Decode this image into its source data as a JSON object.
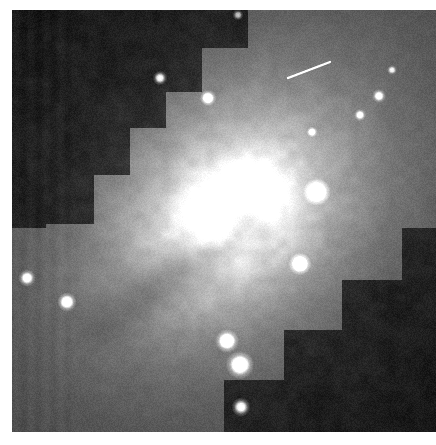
{
  "image": {
    "kind": "astronomical-observation",
    "subject": "spiral galaxy with bright nucleus and dust lane",
    "instrument_pattern": "wfpc2-stepped-mosaic",
    "frame": {
      "x": 12,
      "y": 10,
      "width": 424,
      "height": 422
    },
    "background_color": "#ffffff",
    "sky_color": "#101010",
    "colors": {
      "deep_sky": "#0c0c0c",
      "chip_sky": "#232323",
      "outer_galaxy": "#6f6f6f",
      "mid_galaxy": "#a8a8a8",
      "inner_galaxy": "#d8d8d8",
      "nucleus": "#fdfdfd",
      "dust_lane": "#8a8a8a",
      "star": "#ffffff"
    },
    "galaxy": {
      "nucleus_cx": 222,
      "nucleus_cy": 200,
      "nucleus_radius": 34,
      "halo_radius": 200,
      "position_angle_deg": -38,
      "axis_ratio": 0.76,
      "dust_lane": {
        "from_x": 80,
        "from_y": 320,
        "to_x": 240,
        "to_y": 215,
        "width": 16,
        "opacity": 0.34
      }
    },
    "chip_mask": {
      "note": "Stepped mosaic cut-out: dark sky wedges at upper-left and lower-right",
      "step": 40,
      "upper_left_steps": [
        {
          "x": 0,
          "y": 0,
          "w": 236,
          "h": 38
        },
        {
          "x": 0,
          "y": 0,
          "w": 190,
          "h": 82
        },
        {
          "x": 0,
          "y": 0,
          "w": 154,
          "h": 118
        },
        {
          "x": 0,
          "y": 0,
          "w": 118,
          "h": 165
        },
        {
          "x": 0,
          "y": 0,
          "w": 82,
          "h": 214
        },
        {
          "x": 0,
          "y": 0,
          "w": 34,
          "h": 218
        }
      ],
      "lower_right_steps": [
        {
          "x": 390,
          "y": 218,
          "w": 34,
          "h": 204
        },
        {
          "x": 330,
          "y": 270,
          "w": 94,
          "h": 152
        },
        {
          "x": 272,
          "y": 320,
          "w": 152,
          "h": 102
        },
        {
          "x": 212,
          "y": 370,
          "w": 212,
          "h": 52
        }
      ]
    },
    "point_sources": [
      {
        "x": 148,
        "y": 68,
        "r": 3.2,
        "brightness": 0.95
      },
      {
        "x": 196,
        "y": 88,
        "r": 3.6,
        "brightness": 0.92
      },
      {
        "x": 305,
        "y": 182,
        "r": 6.0,
        "brightness": 1.0
      },
      {
        "x": 288,
        "y": 254,
        "r": 5.0,
        "brightness": 1.0
      },
      {
        "x": 215,
        "y": 331,
        "r": 5.2,
        "brightness": 1.0
      },
      {
        "x": 228,
        "y": 355,
        "r": 6.2,
        "brightness": 1.0
      },
      {
        "x": 229,
        "y": 397,
        "r": 4.2,
        "brightness": 1.0
      },
      {
        "x": 15,
        "y": 268,
        "r": 3.8,
        "brightness": 0.9
      },
      {
        "x": 55,
        "y": 292,
        "r": 4.2,
        "brightness": 0.95
      },
      {
        "x": 367,
        "y": 86,
        "r": 3.0,
        "brightness": 0.8
      },
      {
        "x": 348,
        "y": 105,
        "r": 2.6,
        "brightness": 0.75
      },
      {
        "x": 300,
        "y": 122,
        "r": 2.4,
        "brightness": 0.7
      },
      {
        "x": 380,
        "y": 60,
        "r": 2.2,
        "brightness": 0.65
      },
      {
        "x": 226,
        "y": 5,
        "r": 2.4,
        "brightness": 0.7
      }
    ],
    "streak": {
      "x1": 276,
      "y1": 68,
      "x2": 318,
      "y2": 52,
      "width": 2.2,
      "opacity": 0.55
    }
  }
}
